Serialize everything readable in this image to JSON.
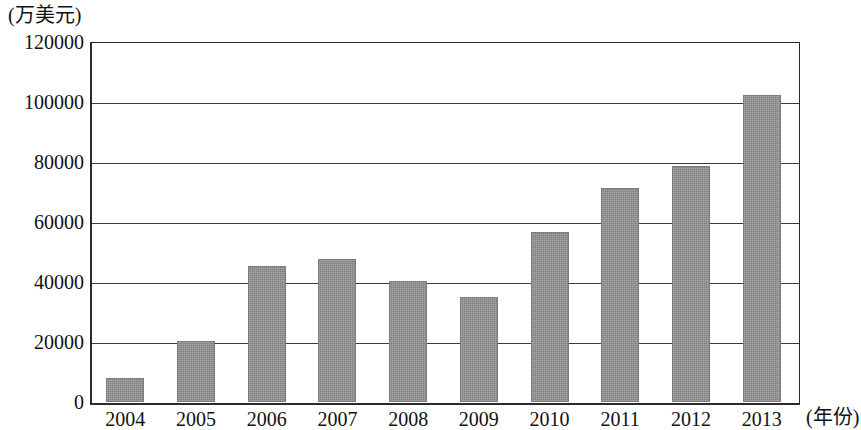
{
  "chart_data": {
    "type": "bar",
    "title": "",
    "subtitle": "",
    "xlabel": "(年份)",
    "ylabel": "(万美元)",
    "categories": [
      "2004",
      "2005",
      "2006",
      "2007",
      "2008",
      "2009",
      "2010",
      "2011",
      "2012",
      "2013"
    ],
    "values": [
      8000,
      20500,
      45300,
      47800,
      40300,
      35000,
      56800,
      71500,
      78800,
      102400
    ],
    "ylim": [
      0,
      120000
    ],
    "xlim_note": "categorical",
    "y_ticks": [
      0,
      20000,
      40000,
      60000,
      80000,
      100000,
      120000
    ],
    "y_tick_labels": [
      "0",
      "20000",
      "40000",
      "60000",
      "80000",
      "100000",
      "120000"
    ],
    "grid": "horizontal",
    "legend": "none",
    "legend_position": "none",
    "bar_color": "#8f8f8f",
    "axis_color": "#2b2b2b",
    "annotations": []
  },
  "axes": {
    "y_unit_caption": "(万美元)",
    "x_unit_caption": "(年份)"
  }
}
